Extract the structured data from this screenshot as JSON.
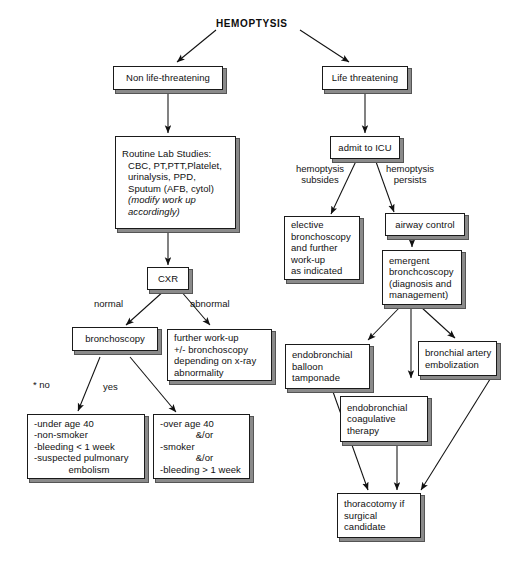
{
  "diagram": {
    "title": "HEMOPTYSIS",
    "type": "clinical-algorithm-flowchart",
    "colors": {
      "ink": "#111111",
      "background": "#ffffff",
      "shadow": "#555555"
    }
  },
  "nodes": {
    "non_life_threatening": {
      "label": "Non life-threatening"
    },
    "life_threatening": {
      "label": "Life threatening"
    },
    "routine_lab": {
      "line1": "Routine Lab Studies:",
      "line2": "CBC, PT,PTT,Platelet,",
      "line3": "urinalysis, PPD,",
      "line4": "Sputum (AFB, cytol)",
      "line5": "(modify work up",
      "line6": "accordingly)"
    },
    "cxr": {
      "label": "CXR"
    },
    "bronchoscopy": {
      "label": "bronchoscopy"
    },
    "further_workup": {
      "line1": "further work-up",
      "line2": "+/- bronchoscopy",
      "line3": "depending on x-ray",
      "line4": "abnormality"
    },
    "low_risk": {
      "line1": "-under age 40",
      "line2": "-non-smoker",
      "line3": "-bleeding < 1 week",
      "line4": "-suspected pulmonary",
      "line5": "embolism"
    },
    "high_risk": {
      "line1": "-over age 40",
      "line2": "&/or",
      "line3": "-smoker",
      "line4": "&/or",
      "line5": "-bleeding > 1 week"
    },
    "admit_icu": {
      "label": "admit to ICU"
    },
    "elective_bronch": {
      "line1": "elective",
      "line2": "bronchoscopy",
      "line3": "and further",
      "line4": "work-up",
      "line5": "as indicated"
    },
    "airway_control": {
      "label": "airway control"
    },
    "emergent_bronch": {
      "line1": "emergent",
      "line2": "bronchcoscopy",
      "line3": "(diagnosis and",
      "line4": "management)"
    },
    "balloon_tamponade": {
      "line1": "endobronchial",
      "line2": "balloon",
      "line3": "tamponade"
    },
    "bronchial_embolization": {
      "line1": "bronchial artery",
      "line2": "embolization"
    },
    "coagulative_therapy": {
      "line1": "endobronchial",
      "line2": "coagulative",
      "line3": "therapy"
    },
    "thoracotomy": {
      "line1": "thoracotomy if",
      "line2": "surgical",
      "line3": "candidate"
    }
  },
  "edge_labels": {
    "normal": "normal",
    "abnormal": "abnormal",
    "no": "* no",
    "yes": "yes",
    "hemoptysis_subsides_l1": "hemoptysis",
    "hemoptysis_subsides_l2": "subsides",
    "hemoptysis_persists_l1": "hemoptysis",
    "hemoptysis_persists_l2": "persists"
  }
}
